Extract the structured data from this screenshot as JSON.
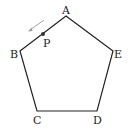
{
  "diagram": {
    "type": "geometry",
    "shape": "regular pentagon",
    "vertices": [
      {
        "label": "A",
        "x": 66,
        "y": 16
      },
      {
        "label": "E",
        "x": 113,
        "y": 51
      },
      {
        "label": "D",
        "x": 97,
        "y": 111
      },
      {
        "label": "C",
        "x": 37,
        "y": 111
      },
      {
        "label": "B",
        "x": 20,
        "y": 51
      }
    ],
    "point": {
      "label": "P",
      "x": 43,
      "y": 34,
      "on_edge": "AB"
    },
    "arrow": {
      "from": [
        44,
        20
      ],
      "to": [
        29,
        31
      ],
      "meaning": "P moves from A toward B"
    },
    "colors": {
      "stroke": "#222222",
      "arrow": "#888888",
      "background": "#ffffff"
    }
  }
}
